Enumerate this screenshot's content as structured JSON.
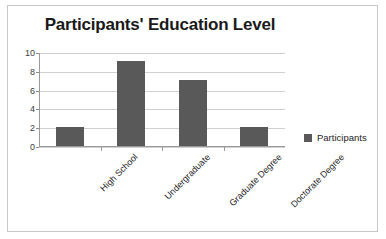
{
  "chart_data": {
    "type": "bar",
    "title": "Participants' Education Level",
    "categories": [
      "High School",
      "Undergraduate",
      "Graduate Degree",
      "Doctorate Degree"
    ],
    "values": [
      2,
      9,
      7,
      2
    ],
    "series": [
      {
        "name": "Participants",
        "values": [
          2,
          9,
          7,
          2
        ]
      }
    ],
    "xlabel": "",
    "ylabel": "",
    "ylim": [
      0,
      10
    ],
    "yticks": [
      0,
      2,
      4,
      6,
      8,
      10
    ],
    "grid": true,
    "legend_position": "right",
    "colors": {
      "bar": "#595959",
      "gridline": "#d0d0d0",
      "axis": "#9a9a9a",
      "title": "#1a1a1a",
      "frame": "#c8c8c8",
      "background": "#ffffff"
    }
  },
  "legend": {
    "entries": [
      {
        "label": "Participants",
        "color": "#595959",
        "marker": "square-marker"
      }
    ]
  }
}
